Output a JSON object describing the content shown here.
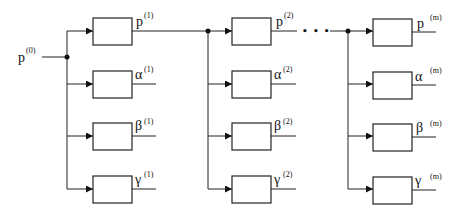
{
  "diagram": {
    "type": "block-diagram",
    "colors": {
      "stroke": "#222222",
      "background": "#ffffff"
    },
    "input": {
      "symbol": "p",
      "superscript": "(0)"
    },
    "ellipsis": "• • •",
    "stages": [
      {
        "index": "1",
        "outputs": [
          {
            "symbol": "p",
            "superscript": "(1)"
          },
          {
            "symbol": "α",
            "superscript": "(1)"
          },
          {
            "symbol": "β",
            "superscript": "(1)"
          },
          {
            "symbol": "γ",
            "superscript": "(1)"
          }
        ]
      },
      {
        "index": "2",
        "outputs": [
          {
            "symbol": "p",
            "superscript": "(2)"
          },
          {
            "symbol": "α",
            "superscript": "(2)"
          },
          {
            "symbol": "β",
            "superscript": "(2)"
          },
          {
            "symbol": "γ",
            "superscript": "(2)"
          }
        ]
      },
      {
        "index": "m",
        "outputs": [
          {
            "symbol": "p",
            "superscript": "(m)"
          },
          {
            "symbol": "α",
            "superscript": "(m)"
          },
          {
            "symbol": "β",
            "superscript": "(m)"
          },
          {
            "symbol": "γ",
            "superscript": "(m)"
          }
        ]
      }
    ]
  }
}
